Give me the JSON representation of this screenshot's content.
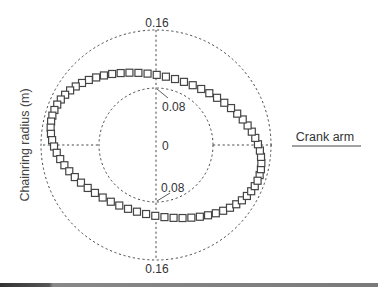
{
  "chart_data": {
    "type": "scatter",
    "subtype": "polar",
    "title": "",
    "ylabel": "Chainring radius (m)",
    "xlabel": "",
    "radial_ticks": [
      0,
      0.08,
      0.16
    ],
    "radial_range": [
      0,
      0.16
    ],
    "grid": true,
    "grid_style": "dashed circles at r=0.08 and r=0.16 with dashed horizontal/vertical axes",
    "legend": {
      "position": "right",
      "entries": [
        {
          "label": "Crank arm",
          "marker": "line"
        }
      ]
    },
    "series": [
      {
        "name": "Chainring radius",
        "marker": "open-square",
        "shape": "tilted ellipse",
        "ellipse": {
          "center_x_m": 0.0,
          "center_y_m": -0.0005,
          "semi_major_m": 0.15,
          "semi_minor_m": 0.096,
          "rotation_deg": -16
        },
        "n_points": 72,
        "points_polar": [
          {
            "angle_deg": 0,
            "r": 0.145
          },
          {
            "angle_deg": 30,
            "r": 0.102
          },
          {
            "angle_deg": 60,
            "r": 0.1
          },
          {
            "angle_deg": 90,
            "r": 0.108
          },
          {
            "angle_deg": 120,
            "r": 0.125
          },
          {
            "angle_deg": 150,
            "r": 0.145
          },
          {
            "angle_deg": 165,
            "r": 0.15
          },
          {
            "angle_deg": 180,
            "r": 0.146
          },
          {
            "angle_deg": 210,
            "r": 0.102
          },
          {
            "angle_deg": 240,
            "r": 0.098
          },
          {
            "angle_deg": 270,
            "r": 0.106
          },
          {
            "angle_deg": 300,
            "r": 0.125
          },
          {
            "angle_deg": 330,
            "r": 0.145
          },
          {
            "angle_deg": 345,
            "r": 0.15
          }
        ]
      }
    ],
    "labels": {
      "outer_top": "0.16",
      "inner_top": "0.08",
      "center": "0",
      "inner_bottom": "0.08",
      "outer_bottom": "0.16"
    },
    "colors": {
      "marker_stroke": "#444444",
      "marker_fill": "#ffffff",
      "grid": "#333333",
      "legend_line": "#444444"
    }
  }
}
